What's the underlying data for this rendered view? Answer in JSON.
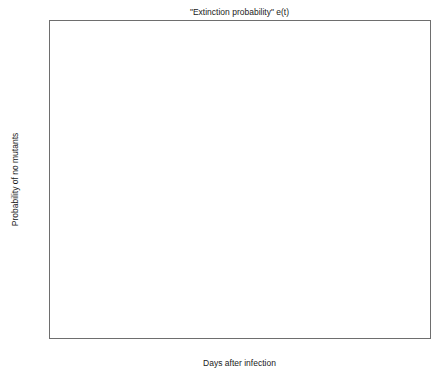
{
  "chart_data": {
    "type": "line",
    "title": "\"Extinction probability\" e(t)",
    "xlabel": "Days after infection",
    "ylabel": "Probability of no mutants",
    "xlim": [
      0,
      30
    ],
    "ylim": [
      0,
      1
    ],
    "grid": false,
    "legend": null,
    "xticks": [
      0,
      5,
      10,
      15,
      20,
      25,
      30
    ],
    "xtick_labels": [
      "0",
      "5",
      "10",
      "15",
      "20",
      "25",
      "30"
    ],
    "yticks": [
      0,
      0.1,
      0.2,
      0.3,
      0.4,
      0.5,
      0.6,
      0.7,
      0.8,
      0.9,
      1
    ],
    "ytick_labels": [
      "0",
      "0.1",
      "0.2",
      "0.3",
      "0.4",
      "0.5",
      "0.6",
      "0.7",
      "0.8",
      "0.9",
      "1"
    ],
    "line_color": "#3c3c3c",
    "axis_color": "#6e6e6e",
    "background": "#ffffff",
    "series": [
      {
        "name": "e(t)",
        "x": [
          0,
          0.25,
          0.5,
          0.75,
          1,
          1.25,
          1.5,
          1.75,
          2,
          2.25,
          2.5,
          2.75,
          3,
          3.25,
          3.5,
          3.75,
          4,
          4.25,
          4.5,
          4.75,
          5,
          5.25,
          5.5,
          5.75,
          6,
          6.25,
          6.5,
          6.75,
          7,
          7.25,
          7.5,
          7.75,
          8,
          8.5,
          9,
          10,
          12,
          15,
          20,
          25,
          30
        ],
        "y": [
          1,
          0.973,
          0.945,
          0.917,
          0.888,
          0.858,
          0.827,
          0.795,
          0.762,
          0.728,
          0.693,
          0.657,
          0.62,
          0.582,
          0.544,
          0.505,
          0.466,
          0.427,
          0.388,
          0.35,
          0.312,
          0.276,
          0.241,
          0.208,
          0.177,
          0.148,
          0.122,
          0.098,
          0.077,
          0.059,
          0.044,
          0.031,
          0.022,
          0.01,
          0.004,
          0.001,
          0,
          0,
          0,
          0,
          0
        ]
      }
    ]
  }
}
